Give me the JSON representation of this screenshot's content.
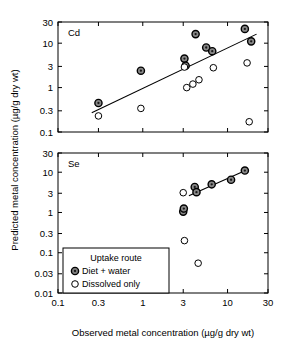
{
  "figure": {
    "xlabel": "Observed metal concentration (µg/g dry wt)",
    "ylabel": "Predicted metal concentration (µg/g dry wt)",
    "legend": {
      "title": "Uptake route",
      "items": [
        {
          "label": "Diet + water",
          "marker": "filled-circle",
          "color": "#808080"
        },
        {
          "label": "Dissolved only",
          "marker": "open-circle",
          "color": "#ffffff"
        }
      ]
    }
  },
  "chart_data": [
    {
      "type": "scatter",
      "title": "Cd",
      "panel": "top",
      "xlabel": "Observed metal concentration (µg/g dry wt)",
      "ylabel": "Predicted metal concentration (µg/g dry wt)",
      "xscale": "log",
      "yscale": "log",
      "xlim": [
        0.1,
        30
      ],
      "ylim": [
        0.1,
        30
      ],
      "xticks": [
        0.1,
        0.3,
        1,
        3,
        10,
        30
      ],
      "xticklabels": [
        "0.1",
        "0.3",
        "1",
        "3",
        "10",
        "30"
      ],
      "yticks": [
        0.1,
        0.3,
        1,
        3,
        10,
        30
      ],
      "yticklabels": [
        "0.1",
        "0.3",
        "1",
        "3",
        "10",
        "30"
      ],
      "grid": false,
      "legend_position": "lower-left-of-figure",
      "series": [
        {
          "name": "Diet + water",
          "marker": "filled-circle",
          "points": [
            [
              0.3,
              0.45
            ],
            [
              0.95,
              2.4
            ],
            [
              3.1,
              4.5
            ],
            [
              3.2,
              3.1
            ],
            [
              4.2,
              16
            ],
            [
              5.6,
              8.0
            ],
            [
              6.6,
              6.6
            ],
            [
              16.0,
              21
            ],
            [
              19.0,
              11
            ]
          ]
        },
        {
          "name": "Dissolved only",
          "marker": "open-circle",
          "points": [
            [
              0.3,
              0.23
            ],
            [
              0.95,
              0.34
            ],
            [
              3.1,
              2.9
            ],
            [
              3.3,
              1.0
            ],
            [
              3.9,
              1.2
            ],
            [
              4.6,
              1.5
            ],
            [
              6.8,
              2.8
            ],
            [
              17.0,
              3.6
            ],
            [
              18.0,
              0.17
            ]
          ]
        }
      ],
      "fit_line": {
        "x": [
          0.25,
          22.0
        ],
        "y": [
          0.27,
          16.0
        ],
        "style": "solid"
      }
    },
    {
      "type": "scatter",
      "title": "Se",
      "panel": "bottom",
      "xlabel": "Observed metal concentration (µg/g dry wt)",
      "ylabel": "Predicted metal concentration (µg/g dry wt)",
      "xscale": "log",
      "yscale": "log",
      "xlim": [
        0.1,
        30
      ],
      "ylim": [
        0.01,
        30
      ],
      "xticks": [
        0.1,
        0.3,
        1,
        3,
        10,
        30
      ],
      "xticklabels": [
        "0.1",
        "0.3",
        "1",
        "3",
        "10",
        "30"
      ],
      "yticks": [
        0.01,
        0.03,
        0.1,
        0.3,
        1,
        3,
        10,
        30
      ],
      "yticklabels": [
        "0.01",
        "0.03",
        "0.1",
        "0.3",
        "1",
        "3",
        "10",
        "30"
      ],
      "grid": false,
      "legend_position": "inside-lower-left",
      "series": [
        {
          "name": "Diet + water",
          "marker": "filled-circle",
          "points": [
            [
              3.0,
              1.05
            ],
            [
              3.05,
              1.25
            ],
            [
              4.1,
              4.3
            ],
            [
              4.3,
              3.2
            ],
            [
              6.5,
              5.0
            ],
            [
              11.0,
              6.5
            ],
            [
              16.0,
              11.0
            ]
          ]
        },
        {
          "name": "Dissolved only",
          "marker": "open-circle",
          "points": [
            [
              3.0,
              3.1
            ],
            [
              3.1,
              0.2
            ],
            [
              4.5,
              0.055
            ]
          ]
        }
      ],
      "fit_line": {
        "x": [
          3.5,
          17.0
        ],
        "y": [
          2.6,
          11.5
        ],
        "style": "solid"
      }
    }
  ]
}
